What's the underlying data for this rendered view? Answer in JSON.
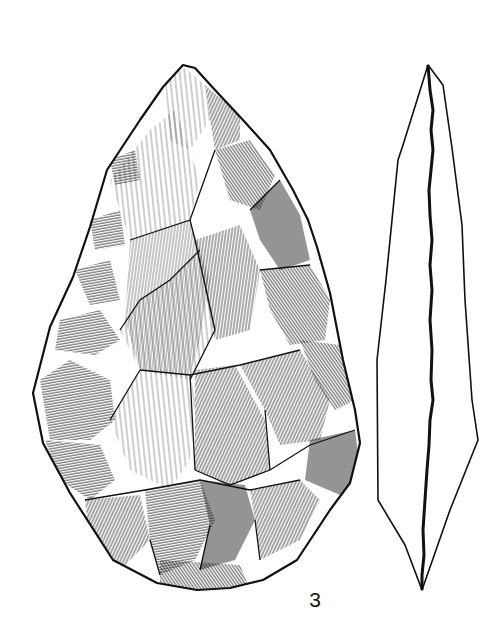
{
  "figure": {
    "views": [
      "face",
      "profile"
    ],
    "label": "3"
  },
  "colors": {
    "ink": "#111111",
    "paper": "#ffffff"
  }
}
